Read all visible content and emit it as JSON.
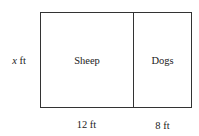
{
  "diagram": {
    "type": "rectangular-pen-divided",
    "regions": [
      {
        "id": "sheep",
        "label": "Sheep",
        "width_label": "12 ft",
        "width_value": 12
      },
      {
        "id": "dogs",
        "label": "Dogs",
        "width_label": "8 ft",
        "width_value": 8
      }
    ],
    "height_label": {
      "variable": "x",
      "unit": "ft"
    },
    "colors": {
      "line": "#333333",
      "text": "#222222",
      "background": "#ffffff"
    }
  }
}
